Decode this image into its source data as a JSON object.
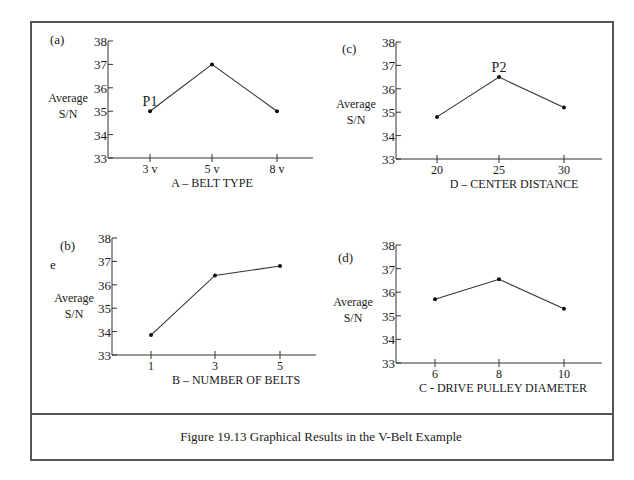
{
  "figure": {
    "caption": "Figure 19.13   Graphical Results in the V-Belt Example"
  },
  "chart_data": [
    {
      "type": "line",
      "panel": "(a)",
      "title": "",
      "categories": [
        "3 v",
        "5 v",
        "8 v"
      ],
      "values": [
        35.0,
        37.0,
        35.0
      ],
      "xlabel": "A – BELT   TYPE",
      "ylabel": "Average S/N",
      "ylim": [
        33,
        38
      ],
      "yticks": [
        33,
        34,
        35,
        36,
        37,
        38
      ],
      "annotations": [
        {
          "text": "P1",
          "at": "3 v"
        }
      ],
      "grid": false,
      "layout": {
        "axis_x": 108,
        "y_top": 41,
        "y_bottom": 158,
        "x_pos": [
          150,
          212,
          277
        ],
        "x_end": 313,
        "xlabel_x": 212,
        "panel_x": 50,
        "panel_y": 44,
        "ylabel_x": 68,
        "ylabel_y": 102
      }
    },
    {
      "type": "line",
      "panel": "(c)",
      "title": "",
      "categories": [
        "20",
        "25",
        "30"
      ],
      "values": [
        34.8,
        36.5,
        35.2
      ],
      "xlabel": "D – CENTER  DISTANCE",
      "ylabel": "Average S/N",
      "ylim": [
        33,
        38
      ],
      "yticks": [
        33,
        34,
        35,
        36,
        37,
        38
      ],
      "annotations": [
        {
          "text": "P2",
          "at": "25"
        }
      ],
      "grid": false,
      "layout": {
        "axis_x": 396,
        "y_top": 42,
        "y_bottom": 159,
        "x_pos": [
          437,
          499,
          564
        ],
        "x_end": 602,
        "xlabel_x": 514,
        "panel_x": 342,
        "panel_y": 53,
        "ylabel_x": 356,
        "ylabel_y": 108
      }
    },
    {
      "type": "line",
      "panel": "(b)",
      "title": "",
      "categories": [
        "1",
        "3",
        "5"
      ],
      "values": [
        33.85,
        36.4,
        36.8
      ],
      "xlabel": "B – NUMBER  OF  BELTS",
      "ylabel": "Average S/N",
      "ylim": [
        33,
        38
      ],
      "yticks": [
        33,
        34,
        35,
        36,
        37,
        38
      ],
      "annotations": [
        {
          "text": "e",
          "at": "side"
        }
      ],
      "grid": false,
      "layout": {
        "axis_x": 112,
        "y_top": 238,
        "y_bottom": 355,
        "x_pos": [
          151,
          215,
          280
        ],
        "x_end": 316,
        "xlabel_x": 236,
        "panel_x": 60,
        "panel_y": 250,
        "ylabel_x": 74,
        "ylabel_y": 302
      }
    },
    {
      "type": "line",
      "panel": "(d)",
      "title": "",
      "categories": [
        "6",
        "8",
        "10"
      ],
      "values": [
        35.7,
        36.55,
        35.3
      ],
      "xlabel": "C - DRIVE PULLEY DIAMETER",
      "ylabel": "Average S/N",
      "ylim": [
        33,
        38
      ],
      "yticks": [
        33,
        34,
        35,
        36,
        37,
        38
      ],
      "annotations": [],
      "grid": false,
      "layout": {
        "axis_x": 396,
        "y_top": 245,
        "y_bottom": 363,
        "x_pos": [
          435,
          499,
          564
        ],
        "x_end": 602,
        "xlabel_x": 503,
        "panel_x": 338,
        "panel_y": 262,
        "ylabel_x": 353,
        "ylabel_y": 306
      }
    }
  ]
}
